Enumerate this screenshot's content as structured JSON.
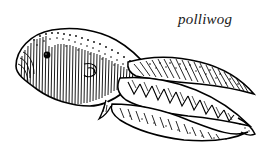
{
  "figure": {
    "kind": "line-art-illustration",
    "subject": "polliwog",
    "caption": "polliwog",
    "background_color": "#ffffff",
    "ink_color": "#000000",
    "caption_color": "#1a1a1a",
    "parts": [
      "head",
      "eye",
      "body",
      "gut-spiral",
      "hind-limb-bud",
      "tail",
      "dorsal-fin",
      "ventral-fin",
      "tail-tip"
    ],
    "shading": [
      "vertical-hatching",
      "stipple-dots",
      "chevron-myomeres",
      "feathered-diagonal-hatching"
    ]
  }
}
